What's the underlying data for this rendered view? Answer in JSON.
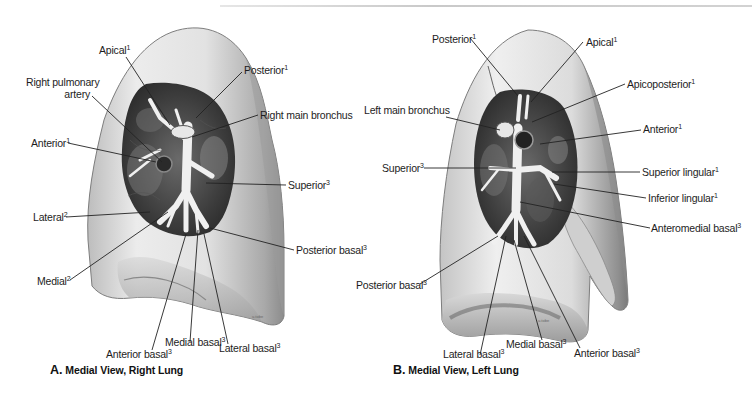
{
  "figure": {
    "panel_a": {
      "caption_letter": "A.",
      "caption_text": "Medial View, Right Lung",
      "labels": [
        {
          "id": "apical",
          "text": "Apical",
          "sup": "1"
        },
        {
          "id": "right-pulmonary-artery-1",
          "text": "Right pulmonary",
          "sup": ""
        },
        {
          "id": "right-pulmonary-artery-2",
          "text": "artery",
          "sup": ""
        },
        {
          "id": "posterior",
          "text": "Posterior",
          "sup": "1"
        },
        {
          "id": "right-main-bronchus",
          "text": "Right main bronchus",
          "sup": ""
        },
        {
          "id": "anterior",
          "text": "Anterior",
          "sup": "1"
        },
        {
          "id": "superior",
          "text": "Superior",
          "sup": "3"
        },
        {
          "id": "lateral",
          "text": "Lateral",
          "sup": "2"
        },
        {
          "id": "posterior-basal",
          "text": "Posterior basal",
          "sup": "3"
        },
        {
          "id": "medial",
          "text": "Medial",
          "sup": "2"
        },
        {
          "id": "medial-basal",
          "text": "Medial basal",
          "sup": "3"
        },
        {
          "id": "lateral-basal",
          "text": "Lateral basal",
          "sup": "3"
        },
        {
          "id": "anterior-basal",
          "text": "Anterior basal",
          "sup": "3"
        }
      ]
    },
    "panel_b": {
      "caption_letter": "B.",
      "caption_text": "Medial View, Left Lung",
      "labels": [
        {
          "id": "posterior",
          "text": "Posterior",
          "sup": "1"
        },
        {
          "id": "apical",
          "text": "Apical",
          "sup": "1"
        },
        {
          "id": "apicoposterior",
          "text": "Apicoposterior",
          "sup": "1"
        },
        {
          "id": "left-main-bronchus",
          "text": "Left main bronchus",
          "sup": ""
        },
        {
          "id": "anterior",
          "text": "Anterior",
          "sup": "1"
        },
        {
          "id": "superior",
          "text": "Superior",
          "sup": "3"
        },
        {
          "id": "superior-lingular",
          "text": "Superior lingular",
          "sup": "1"
        },
        {
          "id": "inferior-lingular",
          "text": "Inferior lingular",
          "sup": "1"
        },
        {
          "id": "anteromedial-basal",
          "text": "Anteromedial basal",
          "sup": "3"
        },
        {
          "id": "posterior-basal",
          "text": "Posterior basal",
          "sup": "3"
        },
        {
          "id": "medial-basal",
          "text": "Medial basal",
          "sup": "3"
        },
        {
          "id": "lateral-basal",
          "text": "Lateral basal",
          "sup": "3"
        },
        {
          "id": "anterior-basal",
          "text": "Anterior basal",
          "sup": "3"
        }
      ]
    },
    "colors": {
      "lung_surface": "#e4e4e4",
      "lung_shadow": "#9a9a9a",
      "hilum_dark": "#3a3a3a",
      "bronchus": "#f2f2f2",
      "leader_line": "#222222"
    }
  }
}
